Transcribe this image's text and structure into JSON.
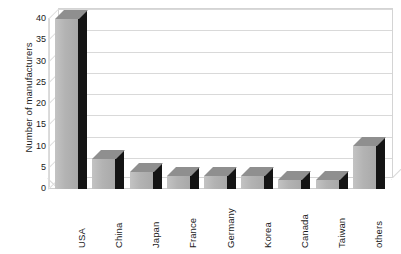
{
  "chart_data": {
    "type": "bar",
    "title": "",
    "subtitle": "",
    "xlabel": "",
    "ylabel": "Number of manufacturers",
    "categories": [
      "USA",
      "China",
      "Japan",
      "France",
      "Germany",
      "Korea",
      "Canada",
      "Taiwan",
      "others"
    ],
    "values": [
      40,
      7,
      4,
      3,
      3,
      3,
      2,
      2,
      10
    ],
    "series": [
      {
        "name": "Number of manufacturers",
        "values": [
          40,
          7,
          4,
          3,
          3,
          3,
          2,
          2,
          10
        ]
      }
    ],
    "ylim": [
      0,
      40
    ],
    "yticks": [
      0,
      5,
      10,
      15,
      20,
      25,
      30,
      35,
      40
    ],
    "ytick_labels": [
      "0",
      "5",
      "10",
      "15",
      "20",
      "25",
      "30",
      "35",
      "40"
    ],
    "grid": true,
    "grid_axis": "y",
    "legend": false,
    "legend_position": "none",
    "style": "3d-column",
    "annotations": [],
    "colors": {
      "bar_front": "#b3b3b3",
      "bar_top": "#8f8f8f",
      "bar_side": "#141414",
      "gridline": "#d9d9d9",
      "text": "#1a1a1a",
      "background": "#ffffff"
    }
  }
}
